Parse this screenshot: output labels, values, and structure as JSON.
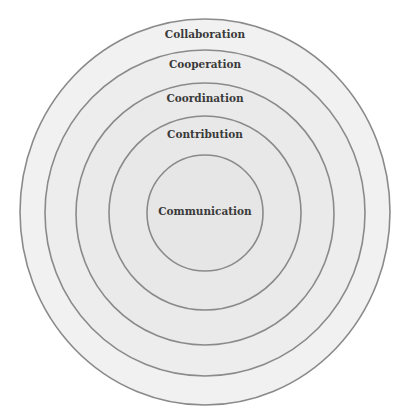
{
  "diagram": {
    "type": "concentric-circles",
    "colors": {
      "stroke": "#8a8a8a",
      "fill_outer": "#efefef",
      "fill_inner": "#e6e6e6",
      "text": "#3a3a3a",
      "background": "#ffffff"
    },
    "rings": [
      {
        "label": "Collaboration",
        "cx": 205,
        "cy": 212,
        "rx": 185,
        "ry": 193,
        "label_y": 38,
        "fill": "#f1f1f1"
      },
      {
        "label": "Cooperation",
        "cx": 205,
        "cy": 213,
        "rx": 160,
        "ry": 163,
        "label_y": 68,
        "fill": "#ededed"
      },
      {
        "label": "Coordination",
        "cx": 205,
        "cy": 214,
        "rx": 129,
        "ry": 131,
        "label_y": 102,
        "fill": "#eaeaea"
      },
      {
        "label": "Contribution",
        "cx": 205,
        "cy": 213,
        "rx": 96,
        "ry": 97,
        "label_y": 138,
        "fill": "#e8e8e8"
      },
      {
        "label": "Communication",
        "cx": 205,
        "cy": 213,
        "rx": 58,
        "ry": 58,
        "label_y": 215,
        "fill": "#e6e6e6"
      }
    ]
  }
}
